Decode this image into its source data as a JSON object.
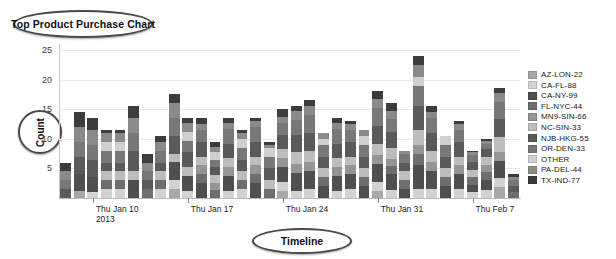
{
  "title": "Top Product Purchase Chart",
  "axis_label_y": "Count",
  "axis_label_x": "Timeline",
  "chart_data": {
    "type": "bar",
    "title": "Top Product Purchase Chart",
    "subtitle": "",
    "xlabel": "Timeline",
    "ylabel": "Count",
    "stacked": true,
    "grid": true,
    "legend_position": "right",
    "ylim": [
      0,
      26
    ],
    "yticks": [
      5,
      10,
      15,
      20,
      25
    ],
    "xtick_labels": [
      "Thu Jan 10",
      "Thu Jan 17",
      "Thu Jan 24",
      "Thu Jan 31",
      "Thu Feb 7"
    ],
    "xtick_sublabel": "2013",
    "xtick_bar_index": [
      2,
      9,
      16,
      23,
      30
    ],
    "categories": [
      "b1",
      "b2",
      "b3",
      "b4",
      "b5",
      "b6",
      "b7",
      "b8",
      "b9",
      "b10",
      "b11",
      "b12",
      "b13",
      "b14",
      "b15",
      "b16",
      "b17",
      "b18",
      "b19",
      "b20",
      "b21",
      "b22",
      "b23",
      "b24",
      "b25",
      "b26",
      "b27",
      "b28",
      "b29",
      "b30",
      "b31",
      "b32",
      "b33",
      "b34"
    ],
    "totals": [
      6,
      14.5,
      13.5,
      11.5,
      11.5,
      15.5,
      7.5,
      10.5,
      17.5,
      13.5,
      13.5,
      9.5,
      13.5,
      11.5,
      13.5,
      9.5,
      15,
      15.5,
      16.5,
      11,
      13.5,
      13,
      11.5,
      18,
      16,
      8,
      24,
      15.5,
      10.5,
      13,
      8,
      10,
      18.5,
      4
    ],
    "series": [
      {
        "name": "AZ-LON-22",
        "color": "#a8a8a8",
        "values": [
          0,
          1.2,
          0,
          0,
          0,
          0,
          0,
          0,
          1.5,
          0,
          0,
          0,
          0,
          0,
          0,
          0,
          1.2,
          0,
          0,
          0,
          0,
          0,
          0,
          1.2,
          0,
          0,
          0,
          0,
          0,
          0,
          0,
          0,
          1.8,
          0
        ]
      },
      {
        "name": "CA-FL-88",
        "color": "#d2d2d2",
        "values": [
          0,
          0,
          1.0,
          1.5,
          1.5,
          0,
          0,
          1.5,
          1.5,
          1.2,
          0,
          0,
          1.2,
          1.5,
          0,
          0,
          1.5,
          1.2,
          1.5,
          0,
          1.2,
          1.5,
          0,
          1.5,
          1.5,
          0,
          1.5,
          1.5,
          0,
          1.5,
          1.2,
          1.5,
          1.5,
          0
        ]
      },
      {
        "name": "CA-NY-99",
        "color": "#4f4f4f",
        "values": [
          0,
          2.8,
          2.5,
          0,
          0,
          3.0,
          0,
          0,
          3.0,
          2.5,
          2.5,
          0,
          2.5,
          0,
          2.5,
          0,
          2.5,
          3.0,
          3.0,
          2.0,
          2.5,
          2.5,
          2.0,
          3.0,
          3.0,
          1.5,
          4.0,
          3.0,
          2.0,
          2.5,
          1.5,
          2.0,
          3.0,
          0
        ]
      },
      {
        "name": "FL-NYC-44",
        "color": "#6e6e6e",
        "values": [
          0,
          0,
          0,
          1.5,
          1.5,
          0,
          1.5,
          1.5,
          0,
          0,
          1.5,
          1.5,
          0,
          1.5,
          1.5,
          1.5,
          0,
          0,
          0,
          1.5,
          0,
          0,
          1.5,
          0,
          1.5,
          1.5,
          2.0,
          0,
          1.5,
          0,
          1.5,
          1.5,
          0,
          1.0
        ]
      },
      {
        "name": "MN9-SIN-66",
        "color": "#959595",
        "values": [
          0,
          0,
          0,
          0,
          0,
          0,
          0,
          0,
          0,
          0,
          1.5,
          1.5,
          1.5,
          0,
          1.5,
          0,
          1.5,
          1.5,
          1.5,
          0,
          1.5,
          1.5,
          0,
          1.5,
          1.5,
          0,
          1.5,
          1.5,
          0,
          1.5,
          0,
          1.5,
          1.5,
          0
        ]
      },
      {
        "name": "NC-SIN-33",
        "color": "#bdbdbd",
        "values": [
          0,
          0,
          0,
          1.5,
          1.5,
          1.5,
          0,
          1.5,
          1.5,
          1.5,
          1.5,
          1.5,
          1.5,
          1.5,
          1.5,
          1.5,
          1.5,
          2.0,
          2.0,
          1.5,
          1.5,
          1.5,
          1.5,
          2.0,
          2.0,
          1.5,
          2.5,
          2.0,
          1.5,
          1.5,
          1.5,
          1.5,
          2.5,
          0
        ]
      },
      {
        "name": "NJB-HKG-55",
        "color": "#5a5a5a",
        "values": [
          1.5,
          3.0,
          3.0,
          1.5,
          1.5,
          3.5,
          1.5,
          1.5,
          3.0,
          2.5,
          2.5,
          1.5,
          2.5,
          2.0,
          2.5,
          2.0,
          2.5,
          3.0,
          3.0,
          2.0,
          2.5,
          2.5,
          2.0,
          3.0,
          3.0,
          1.5,
          4.0,
          3.0,
          2.0,
          2.5,
          1.5,
          1.5,
          3.0,
          1.0
        ]
      },
      {
        "name": "OR-DEN-33",
        "color": "#787878",
        "values": [
          1.5,
          2.5,
          2.5,
          2.0,
          2.0,
          3.0,
          1.5,
          2.0,
          3.0,
          2.0,
          2.0,
          1.5,
          2.5,
          2.0,
          2.5,
          2.0,
          2.0,
          2.5,
          3.0,
          2.0,
          2.5,
          2.0,
          2.0,
          3.0,
          2.5,
          1.5,
          3.5,
          2.5,
          2.0,
          2.0,
          1.5,
          1.0,
          3.0,
          1.0
        ]
      },
      {
        "name": "OTHER",
        "color": "#cfcfcf",
        "values": [
          0,
          0,
          0,
          1.5,
          1.5,
          0,
          0,
          0,
          0,
          1.5,
          0,
          1.5,
          0,
          1.5,
          0,
          1.5,
          0,
          0,
          0,
          1.0,
          0,
          0,
          1.5,
          0,
          0,
          0,
          1.5,
          0,
          1.5,
          0,
          0,
          0,
          0,
          0
        ]
      },
      {
        "name": "PA-DEL-44",
        "color": "#8a8a8a",
        "values": [
          1.5,
          2.5,
          2.5,
          1.5,
          1.5,
          2.5,
          1.5,
          1.5,
          2.5,
          1.5,
          1.0,
          1.0,
          1.0,
          1.0,
          1.0,
          0.5,
          1.0,
          1.5,
          1.5,
          1.0,
          1.0,
          1.0,
          1.0,
          1.5,
          1.5,
          0.5,
          2.0,
          1.0,
          0,
          1.0,
          0.5,
          0.5,
          1.5,
          0.5
        ]
      },
      {
        "name": "TX-IND-77",
        "color": "#3c3c3c",
        "values": [
          1.5,
          2.5,
          2.0,
          0.5,
          0.5,
          2.0,
          1.5,
          1.0,
          1.5,
          0.8,
          1.0,
          1.0,
          0.8,
          0.5,
          0.5,
          0.5,
          1.3,
          0.8,
          1.0,
          0.0,
          0.8,
          0.5,
          0.0,
          1.3,
          1.5,
          0.0,
          1.5,
          1.0,
          0.0,
          0.5,
          0.3,
          0.5,
          0.7,
          0.5
        ]
      }
    ]
  },
  "legend": {
    "items": [
      {
        "label": "AZ-LON-22",
        "color": "#a8a8a8"
      },
      {
        "label": "CA-FL-88",
        "color": "#d2d2d2"
      },
      {
        "label": "CA-NY-99",
        "color": "#4f4f4f"
      },
      {
        "label": "FL-NYC-44",
        "color": "#6e6e6e"
      },
      {
        "label": "MN9-SIN-66",
        "color": "#959595"
      },
      {
        "label": "NC-SIN-33",
        "color": "#bdbdbd"
      },
      {
        "label": "NJB-HKG-55",
        "color": "#5a5a5a"
      },
      {
        "label": "OR-DEN-33",
        "color": "#787878"
      },
      {
        "label": "OTHER",
        "color": "#cfcfcf"
      },
      {
        "label": "PA-DEL-44",
        "color": "#8a8a8a"
      },
      {
        "label": "TX-IND-77",
        "color": "#3c3c3c"
      }
    ]
  }
}
